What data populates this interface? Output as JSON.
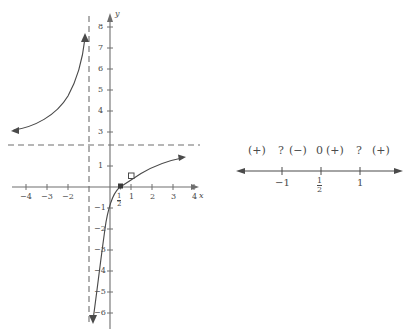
{
  "figure": {
    "title_cut_off": "",
    "graph": {
      "name": "rational-function-graph",
      "axis_labels": {
        "x": "x",
        "y": "y"
      },
      "x_ticks": [
        {
          "value": -4,
          "label": "−4"
        },
        {
          "value": -3,
          "label": "−3"
        },
        {
          "value": -2,
          "label": "−2"
        },
        {
          "value": 1,
          "label": "1"
        },
        {
          "value": 2,
          "label": "2"
        },
        {
          "value": 3,
          "label": "3"
        },
        {
          "value": 4,
          "label": "4"
        }
      ],
      "x_special_tick": {
        "value": 0.5,
        "num": "1",
        "den": "2"
      },
      "y_ticks": [
        {
          "value": 8,
          "label": "8"
        },
        {
          "value": 7,
          "label": "7"
        },
        {
          "value": 6,
          "label": "6"
        },
        {
          "value": 5,
          "label": "5"
        },
        {
          "value": 4,
          "label": "4"
        },
        {
          "value": 3,
          "label": "3"
        },
        {
          "value": 1,
          "label": "1"
        },
        {
          "value": -1,
          "label": "−1"
        },
        {
          "value": -2,
          "label": "−2"
        },
        {
          "value": -3,
          "label": "−3"
        },
        {
          "value": -4,
          "label": "−4"
        },
        {
          "value": -5,
          "label": "−5"
        },
        {
          "value": -6,
          "label": "−6"
        }
      ],
      "asymptotes": {
        "vertical_x": -1,
        "horizontal_y": 2
      },
      "points": [
        {
          "kind": "filled",
          "x": 0.5,
          "y": 0.0
        },
        {
          "kind": "open",
          "x": 1.0,
          "y": 0.5
        }
      ],
      "colors": {
        "curve": "#4a4a4a",
        "axis": "#6e6e6e",
        "asymptote": "#6e6e6e",
        "text": "#4a4a4a"
      }
    },
    "sign_chart": {
      "name": "sign-chart",
      "signs": [
        "(+)",
        "?",
        "(−)",
        "0",
        "(+)",
        "?",
        "(+)"
      ],
      "tick_labels": [
        {
          "label": "−1",
          "is_fraction": false
        },
        {
          "label": "1/2",
          "is_fraction": true,
          "num": "1",
          "den": "2"
        },
        {
          "label": "1",
          "is_fraction": false
        }
      ],
      "line_color": "#4a4a4a"
    }
  }
}
